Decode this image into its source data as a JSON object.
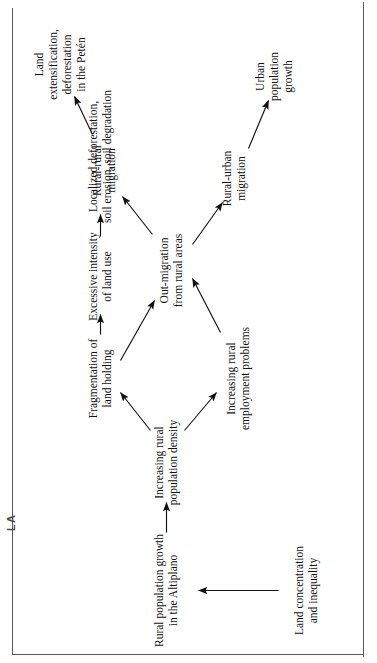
{
  "document": {
    "running_head": "GUATEMALA",
    "frame": true
  },
  "diagram": {
    "type": "flow-diagram",
    "orientation": "rotated-90-ccw",
    "title": "",
    "nodes": [
      {
        "id": "land-concentration",
        "label": "Land concentration\nand inequality",
        "x": 62,
        "y": 290
      },
      {
        "id": "rural-population-growth",
        "label": "Rural population growth\nin the Altiplano",
        "x": 62,
        "y": 150
      },
      {
        "id": "increasing-density",
        "label": "Increasing rural\npopulation density",
        "x": 190,
        "y": 150
      },
      {
        "id": "fragmentation",
        "label": "Fragmentation of\nland holding",
        "x": 274,
        "y": 84
      },
      {
        "id": "employment-problems",
        "label": "Increasing rural\nemployment problems",
        "x": 274,
        "y": 222
      },
      {
        "id": "excessive-intensity",
        "label": "Excessive intensity\nof land use",
        "x": 376,
        "y": 84
      },
      {
        "id": "localized-deforestation",
        "label": "Localized deforestation,\nsoil erosion, soil degradation",
        "x": 496,
        "y": 84
      },
      {
        "id": "out-migration",
        "label": "Out-migration\nfrom rural areas",
        "x": 382,
        "y": 155
      },
      {
        "id": "rural-urban-migration",
        "label": "Rural-urban\nmigration",
        "x": 474,
        "y": 218
      },
      {
        "id": "urban-population-growth",
        "label": "Urban\npopulation growth",
        "x": 576,
        "y": 258
      },
      {
        "id": "rural-rural-migration",
        "label": "Rural-rural\nmigration",
        "x": 482,
        "y": 88
      },
      {
        "id": "land-extensification",
        "label": "Land extensification,\ndeforestation in the Petén",
        "x": 588,
        "y": 44
      }
    ],
    "edges": [
      {
        "from": "land-concentration",
        "to": "rural-population-growth"
      },
      {
        "from": "rural-population-growth",
        "to": "increasing-density"
      },
      {
        "from": "increasing-density",
        "to": "fragmentation"
      },
      {
        "from": "increasing-density",
        "to": "employment-problems"
      },
      {
        "from": "fragmentation",
        "to": "excessive-intensity"
      },
      {
        "from": "excessive-intensity",
        "to": "localized-deforestation"
      },
      {
        "from": "fragmentation",
        "to": "out-migration"
      },
      {
        "from": "employment-problems",
        "to": "out-migration"
      },
      {
        "from": "out-migration",
        "to": "rural-urban-migration"
      },
      {
        "from": "rural-urban-migration",
        "to": "urban-population-growth"
      },
      {
        "from": "out-migration",
        "to": "rural-rural-migration"
      },
      {
        "from": "rural-rural-migration",
        "to": "land-extensification"
      }
    ],
    "colors": {
      "ink": "#111111",
      "rule": "#5a5a5a",
      "background": "#ffffff"
    }
  }
}
